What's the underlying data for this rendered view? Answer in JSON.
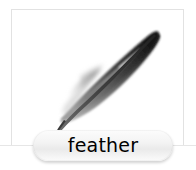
{
  "card": {
    "name": "picture-card",
    "background_color": "#ffffff",
    "border_color": "#e2e2e2"
  },
  "illustration": {
    "subject": "feather",
    "icon_name": "feather-illustration",
    "description": "A grey and black bird feather angled from lower-left quill to upper-right tip, with wispy down near the base",
    "colors": {
      "vane_dark": "#2b2b2b",
      "vane_mid": "#6a6a6a",
      "vane_light": "#b9b9b9",
      "down": "#cfcfcf",
      "shaft": "#4a4a4a"
    }
  },
  "label": {
    "name": "word-label-pill",
    "text": "feather",
    "text_color": "#000000",
    "pill_fill_top": "#fcfcfc",
    "pill_fill_bottom": "#eaeaea"
  },
  "baseline": {
    "name": "horizontal-rule",
    "color": "#e6e6e6"
  }
}
